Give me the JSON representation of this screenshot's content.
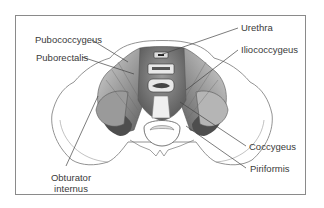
{
  "figure": {
    "labels": {
      "pubococcygeus": "Pubococcygeus",
      "puborectalis": "Puborectalis",
      "urethra": "Urethra",
      "iliococcygeus": "Iliococcygeus",
      "coccygeus": "Coccygeus",
      "piriformis": "Piriformis",
      "obturator_internus_line1": "Obturator",
      "obturator_internus_line2": "internus"
    },
    "colors": {
      "frame": "#8a8a8a",
      "line": "#444444",
      "muscle_dark": "#6e6e6e",
      "muscle_light": "#bdbdbd",
      "bone": "#ffffff",
      "text": "#3a3a3a"
    }
  }
}
